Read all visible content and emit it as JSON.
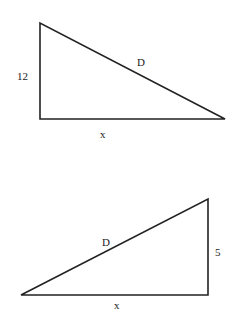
{
  "triangles": [
    {
      "name": "triangle-top",
      "vertices": {
        "top": [
          40,
          23
        ],
        "right_angle": [
          40,
          119
        ],
        "far": [
          225,
          119
        ]
      },
      "labels": {
        "vertical_side": "12",
        "hypotenuse": "D",
        "base": "x"
      }
    },
    {
      "name": "triangle-bottom",
      "vertices": {
        "top": [
          208,
          199
        ],
        "right_angle": [
          208,
          295
        ],
        "far": [
          21,
          295
        ]
      },
      "labels": {
        "vertical_side": "5",
        "hypotenuse": "D",
        "base": "x"
      }
    }
  ],
  "colors": {
    "stroke": "#222222",
    "background": "#ffffff"
  }
}
